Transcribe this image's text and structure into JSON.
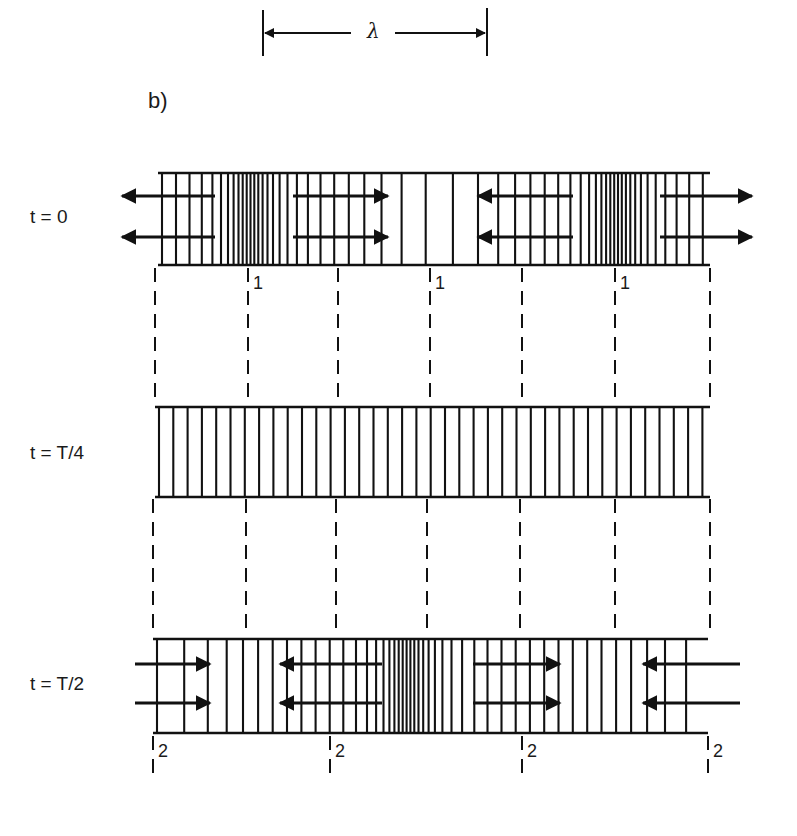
{
  "panel_label": "b)",
  "wavelength": {
    "symbol": "λ",
    "x_start": 263,
    "x_end": 487,
    "y": 33
  },
  "strips": [
    {
      "id": "t0",
      "label": "t = 0",
      "x0": 158,
      "x1": 710,
      "y0": 173,
      "y1": 265,
      "compressions": [
        248,
        615
      ],
      "rarefactions": [
        430
      ],
      "arrows": [
        {
          "from": 215,
          "to": 122,
          "y": [
            196,
            237
          ]
        },
        {
          "from": 293,
          "to": 388,
          "y": [
            196,
            237
          ]
        },
        {
          "from": 573,
          "to": 478,
          "y": [
            196,
            237
          ]
        },
        {
          "from": 660,
          "to": 752,
          "y": [
            196,
            237
          ]
        }
      ],
      "node_marks": [
        {
          "x": 248,
          "text": "1"
        },
        {
          "x": 430,
          "text": "1"
        },
        {
          "x": 615,
          "text": "1"
        }
      ]
    },
    {
      "id": "tT4",
      "label": "t = T/4",
      "x0": 155,
      "x1": 710,
      "y0": 407,
      "y1": 497,
      "compressions": [],
      "rarefactions": [],
      "arrows": [],
      "node_marks": []
    },
    {
      "id": "tT2",
      "label": "t = T/2",
      "x0": 153,
      "x1": 708,
      "y0": 639,
      "y1": 733,
      "compressions": [
        405
      ],
      "rarefactions": [
        153,
        708
      ],
      "arrows": [
        {
          "from": 135,
          "to": 210,
          "y": [
            664,
            703
          ]
        },
        {
          "from": 382,
          "to": 280,
          "y": [
            664,
            703
          ]
        },
        {
          "from": 473,
          "to": 560,
          "y": [
            664,
            703
          ]
        },
        {
          "from": 740,
          "to": 643,
          "y": [
            664,
            703
          ]
        }
      ],
      "node_marks": [
        {
          "x": 153,
          "text": "2"
        },
        {
          "x": 330,
          "text": "2"
        },
        {
          "x": 522,
          "text": "2"
        },
        {
          "x": 708,
          "text": "2"
        }
      ]
    }
  ],
  "dashed_guides": {
    "between_0_and_1": {
      "y0": 268,
      "y1": 405,
      "x": [
        155,
        248,
        338,
        430,
        522,
        615,
        710
      ]
    },
    "between_1_and_2": {
      "y0": 499,
      "y1": 637,
      "x": [
        153,
        246,
        336,
        427,
        520,
        615,
        710
      ]
    },
    "below_2": {
      "y0": 736,
      "y1": 782,
      "x": [
        153,
        330,
        522,
        708
      ]
    }
  },
  "colors": {
    "ink": "#111111",
    "paper": "#ffffff"
  }
}
